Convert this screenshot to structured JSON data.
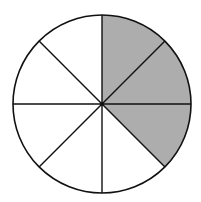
{
  "diagram": {
    "type": "fraction-circle",
    "total_parts": 8,
    "shaded_parts": 3,
    "shaded_indices": [
      0,
      1,
      2
    ],
    "start_angle_deg": -90,
    "direction": "clockwise",
    "fraction_label": "3/8",
    "colors": {
      "shaded": "#adadad",
      "unshaded": "#ffffff",
      "stroke": "#111111"
    },
    "geometry": {
      "cx": 102,
      "cy": 104,
      "r": 89
    }
  }
}
